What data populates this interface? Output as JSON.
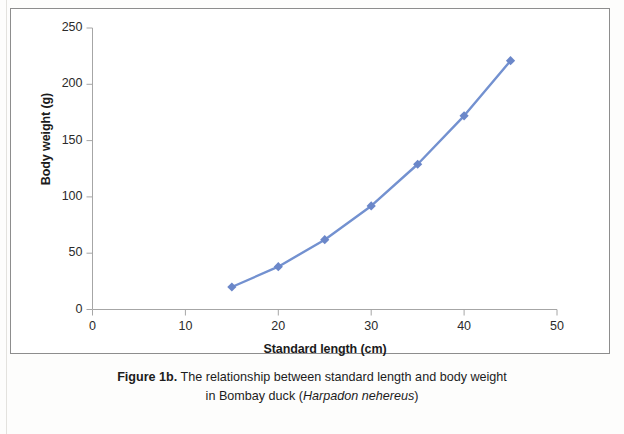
{
  "figure": {
    "caption_label": "Figure 1b.",
    "caption_text": " The relationship between standard length and body weight",
    "caption_line2_prefix": "in Bombay duck (",
    "caption_species": "Harpadon nehereus",
    "caption_line2_suffix": ")"
  },
  "colors": {
    "series": "#7391d0",
    "series_marker": "#6b87c9",
    "axis": "#a6a6a6",
    "frame": "#8d8d8d",
    "text": "#1b1b1b"
  },
  "chart_data": {
    "type": "line",
    "title": "",
    "xlabel": "Standard length (cm)",
    "ylabel": "Body weight (g)",
    "x": [
      15,
      20,
      25,
      30,
      35,
      40,
      45
    ],
    "values": [
      20,
      38,
      62,
      92,
      129,
      172,
      221
    ],
    "series": [
      {
        "name": "Body weight",
        "x": [
          15,
          20,
          25,
          30,
          35,
          40,
          45
        ],
        "values": [
          20,
          38,
          62,
          92,
          129,
          172,
          221
        ]
      }
    ],
    "xlim": [
      0,
      50
    ],
    "ylim": [
      0,
      250
    ],
    "xticks": [
      0,
      10,
      20,
      30,
      40,
      50
    ],
    "yticks": [
      0,
      50,
      100,
      150,
      200,
      250
    ],
    "xtick_labels": [
      "0",
      "10",
      "20",
      "30",
      "40",
      "50"
    ],
    "ytick_labels": [
      "0",
      "50",
      "100",
      "150",
      "200",
      "250"
    ],
    "grid": false,
    "legend": false,
    "marker": "diamond"
  }
}
